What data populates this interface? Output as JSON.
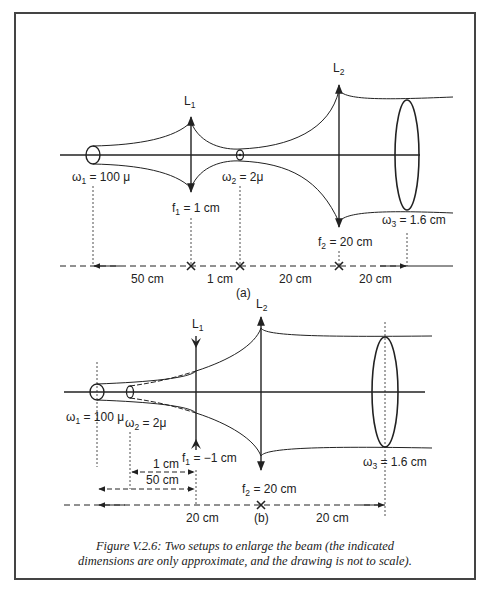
{
  "diagram_a": {
    "id": "(a)",
    "lens1": {
      "name": "L",
      "sub": "1",
      "focal_label": "f",
      "focal_sub": "1",
      "focal_value": " = 1 cm",
      "type": "converging"
    },
    "lens2": {
      "name": "L",
      "sub": "2",
      "focal_label": "f",
      "focal_sub": "2",
      "focal_value": " = 20 cm",
      "type": "converging"
    },
    "waist1": {
      "sym": "ω",
      "sub": "1",
      "value": " = 100 μ"
    },
    "waist2": {
      "sym": "ω",
      "sub": "2",
      "value": " = 2μ"
    },
    "waist3": {
      "sym": "ω",
      "sub": "3",
      "value": " = 1.6 cm"
    },
    "distances": [
      "50 cm",
      "1 cm",
      "20 cm",
      "20 cm"
    ]
  },
  "diagram_b": {
    "id": "(b)",
    "lens1": {
      "name": "L",
      "sub": "1",
      "focal_label": "f",
      "focal_sub": "1",
      "focal_value": " = −1 cm",
      "type": "diverging"
    },
    "lens2": {
      "name": "L",
      "sub": "2",
      "focal_label": "f",
      "focal_sub": "2",
      "focal_value": " = 20 cm",
      "type": "converging"
    },
    "waist1": {
      "sym": "ω",
      "sub": "1",
      "value": " = 100  μ"
    },
    "waist2": {
      "sym": "ω",
      "sub": "2",
      "value": " = 2μ"
    },
    "waist3": {
      "sym": "ω",
      "sub": "3",
      "value": " = 1.6 cm"
    },
    "distances": [
      "1 cm",
      "50 cm",
      "20 cm",
      "20 cm"
    ]
  },
  "caption": {
    "line1": "Figure V.2.6: Two setups to enlarge the beam (the indicated",
    "line2": "dimensions are only approximate, and the drawing is not to scale)."
  }
}
